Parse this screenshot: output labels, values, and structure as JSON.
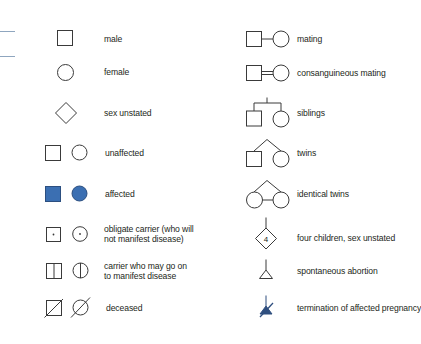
{
  "colors": {
    "line": "#3a3a3a",
    "affected_fill": "#3b6fb2",
    "termination_fill": "#2f4f7f",
    "edge_rule": "#8fa6bf"
  },
  "legend": {
    "left": [
      {
        "symbol": "square",
        "label": "male"
      },
      {
        "symbol": "circle",
        "label": "female"
      },
      {
        "symbol": "diamond",
        "label": "sex unstated"
      },
      {
        "symbol": "square-circle-open",
        "label": "unaffected"
      },
      {
        "symbol": "square-circle-filled",
        "label": "affected"
      },
      {
        "symbol": "square-circle-dot",
        "label_line1": "obligate carrier (who will",
        "label_line2": "not manifest disease)"
      },
      {
        "symbol": "square-circle-vertical-line",
        "label_line1": "carrier who may go on",
        "label_line2": "to manifest disease"
      },
      {
        "symbol": "square-circle-slash",
        "label": "deceased"
      }
    ],
    "right": [
      {
        "symbol": "mating",
        "label": "mating"
      },
      {
        "symbol": "consanguineous-mating",
        "label": "consanguineous mating"
      },
      {
        "symbol": "siblings",
        "label": "siblings"
      },
      {
        "symbol": "twins",
        "label": "twins"
      },
      {
        "symbol": "identical-twins",
        "label": "identical twins"
      },
      {
        "symbol": "diamond-number",
        "number": "4",
        "label": "four children, sex unstated"
      },
      {
        "symbol": "triangle",
        "label": "spontaneous abortion"
      },
      {
        "symbol": "triangle-filled-slash",
        "label": "termination of affected pregnancy"
      }
    ]
  }
}
